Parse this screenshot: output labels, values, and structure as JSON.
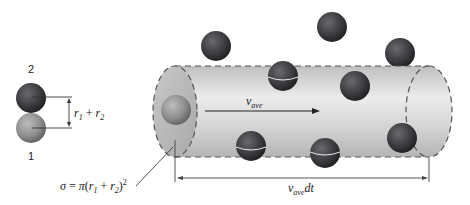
{
  "figure": {
    "type": "collision-cylinder-diagram",
    "colors": {
      "molecule_dark": "#3a3a3d",
      "molecule_light": "#8a8a8a",
      "cylinder_fill": "#d0d0d0",
      "cap_fill": "#bdbdbd",
      "dash_line": "#555555",
      "line": "#333333"
    }
  },
  "pair": {
    "top_label": "2",
    "bottom_label": "1",
    "distance_label": {
      "r1_var": "r",
      "r1_sub": "1",
      "plus": " + ",
      "r2_var": "r",
      "r2_sub": "2"
    }
  },
  "cross_section": {
    "sigma": "σ",
    "eq": " = ",
    "pi": "π",
    "open": "(",
    "r1_var": "r",
    "r1_sub": "1",
    "plus": " + ",
    "r2_var": "r",
    "r2_sub": "2",
    "close": ")",
    "exp": "2"
  },
  "velocity": {
    "var": "v",
    "sub": "ave"
  },
  "length": {
    "var": "v",
    "sub": "ave",
    "suffix": "dt"
  }
}
